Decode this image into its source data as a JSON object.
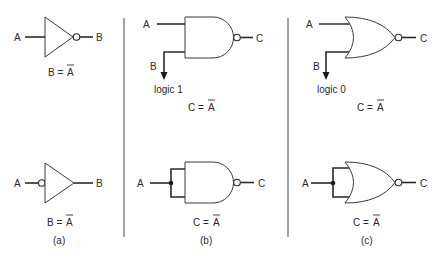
{
  "figure": {
    "panels": [
      {
        "id": "a",
        "caption": "(a)",
        "top": {
          "gate": "NOT (inverter, output bubble)",
          "input_label": "A",
          "output_label": "B",
          "equation_lhs": "B =",
          "equation_rhs": "A"
        },
        "bottom": {
          "gate": "NOT (inverter, input bubble)",
          "input_label": "A",
          "output_label": "B",
          "equation_lhs": "B =",
          "equation_rhs": "A"
        }
      },
      {
        "id": "b",
        "caption": "(b)",
        "top": {
          "gate": "NAND with B tied to logic 1",
          "input_a_label": "A",
          "input_b_label": "B",
          "tie_label": "logic 1",
          "output_label": "C",
          "equation_lhs": "C =",
          "equation_rhs": "A"
        },
        "bottom": {
          "gate": "NAND with inputs tied together",
          "input_label": "A",
          "output_label": "C",
          "equation_lhs": "C =",
          "equation_rhs": "A"
        }
      },
      {
        "id": "c",
        "caption": "(c)",
        "top": {
          "gate": "NOR with B tied to logic 0",
          "input_a_label": "A",
          "input_b_label": "B",
          "tie_label": "logic 0",
          "output_label": "C",
          "equation_lhs": "C =",
          "equation_rhs": "A"
        },
        "bottom": {
          "gate": "NOR with inputs tied together",
          "input_label": "A",
          "output_label": "C",
          "equation_lhs": "C =",
          "equation_rhs": "A"
        }
      }
    ]
  }
}
